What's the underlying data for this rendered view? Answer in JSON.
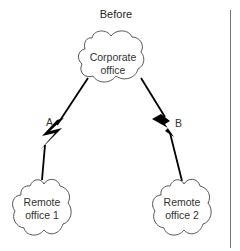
{
  "diagram": {
    "title": "Before",
    "nodes": [
      {
        "id": "corporate",
        "label_line1": "Corporate",
        "label_line2": "office"
      },
      {
        "id": "remote1",
        "label_line1": "Remote",
        "label_line2": "office 1"
      },
      {
        "id": "remote2",
        "label_line1": "Remote",
        "label_line2": "office 2"
      }
    ],
    "links": [
      {
        "id": "A",
        "label": "A",
        "from": "corporate",
        "to": "remote1"
      },
      {
        "id": "B",
        "label": "B",
        "from": "corporate",
        "to": "remote2"
      }
    ],
    "colors": {
      "stroke": "#333333",
      "bolt": "#000000",
      "divider": "#777777"
    }
  }
}
